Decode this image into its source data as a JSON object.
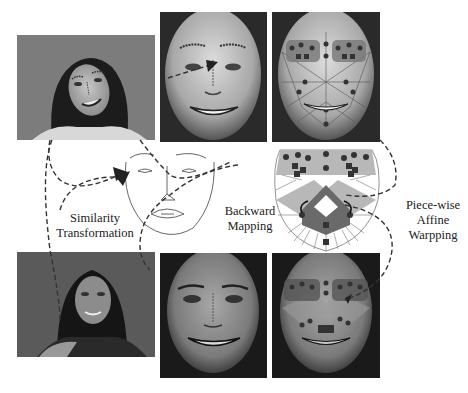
{
  "diagram": {
    "labels": {
      "similarity": [
        "Similarity",
        "Transformation"
      ],
      "backward": [
        "Backward",
        "Mapping"
      ],
      "piecewise": [
        "Piece-wise",
        "Affine",
        "Warpping"
      ]
    },
    "panels": [
      {
        "id": "input-photo-top",
        "desc": "original photo, tilted smiling face"
      },
      {
        "id": "aligned-face-top",
        "desc": "similarity-aligned face with landmarks"
      },
      {
        "id": "mesh-face-top",
        "desc": "face with triangulated mesh and landmarks"
      },
      {
        "id": "mean-shape-sketch",
        "desc": "line drawing mean face shape"
      },
      {
        "id": "mesh-template",
        "desc": "triangulated mesh template"
      },
      {
        "id": "input-photo-bottom",
        "desc": "original photo, frontal face"
      },
      {
        "id": "aligned-face-bottom",
        "desc": "similarity-aligned face"
      },
      {
        "id": "mesh-face-bottom",
        "desc": "face with mesh and landmarks"
      }
    ],
    "colors": {
      "background": "#ffffff",
      "photo_bg_top": "#7a7a7a",
      "photo_bg_bottom": "#555555",
      "mesh_gray": "#b8b8b8",
      "mesh_dark": "#6a6a6a",
      "arrow": "#333333"
    }
  }
}
